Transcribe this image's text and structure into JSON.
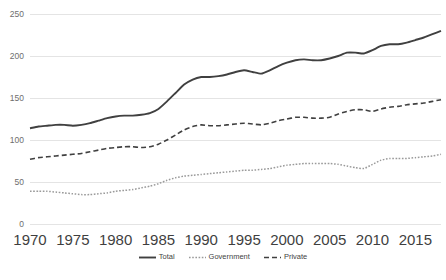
{
  "chart_data": {
    "type": "line",
    "title": "",
    "subtitle": "",
    "xlabel": "",
    "ylabel": "",
    "xlim": [
      1970,
      2018
    ],
    "ylim": [
      0,
      250
    ],
    "grid": true,
    "legend_position": "bottom",
    "x_ticks": [
      "1970",
      "1975",
      "1980",
      "1985",
      "1990",
      "1995",
      "2000",
      "2005",
      "2010",
      "2015"
    ],
    "y_ticks": [
      "0",
      "50",
      "100",
      "150",
      "200",
      "250"
    ],
    "x": [
      1970,
      1971,
      1972,
      1973,
      1974,
      1975,
      1976,
      1977,
      1978,
      1979,
      1980,
      1981,
      1982,
      1983,
      1984,
      1985,
      1986,
      1987,
      1988,
      1989,
      1990,
      1991,
      1992,
      1993,
      1994,
      1995,
      1996,
      1997,
      1998,
      1999,
      2000,
      2001,
      2002,
      2003,
      2004,
      2005,
      2006,
      2007,
      2008,
      2009,
      2010,
      2011,
      2012,
      2013,
      2014,
      2015,
      2016,
      2017,
      2018
    ],
    "series": [
      {
        "name": "Total",
        "style": "solid",
        "color": "#404040",
        "values": [
          114,
          116,
          117,
          118,
          118,
          117,
          118,
          120,
          123,
          126,
          128,
          129,
          129,
          130,
          132,
          137,
          146,
          156,
          166,
          172,
          175,
          175,
          176,
          178,
          181,
          183,
          181,
          179,
          183,
          188,
          192,
          195,
          196,
          195,
          195,
          197,
          200,
          204,
          204,
          203,
          207,
          212,
          214,
          214,
          216,
          219,
          222,
          226,
          230
        ]
      },
      {
        "name": "Government",
        "style": "dotted",
        "color": "#9a9a9a",
        "values": [
          39,
          39,
          39,
          38,
          37,
          36,
          35,
          35,
          36,
          37,
          39,
          40,
          41,
          43,
          45,
          48,
          52,
          55,
          57,
          58,
          59,
          60,
          61,
          62,
          63,
          64,
          64,
          65,
          66,
          68,
          70,
          71,
          72,
          72,
          72,
          72,
          71,
          69,
          67,
          66,
          71,
          76,
          78,
          78,
          78,
          79,
          80,
          81,
          83
        ]
      },
      {
        "name": "Private",
        "style": "dashed",
        "color": "#404040",
        "values": [
          77,
          79,
          80,
          81,
          82,
          83,
          84,
          86,
          88,
          90,
          91,
          92,
          92,
          91,
          92,
          95,
          100,
          106,
          112,
          116,
          118,
          117,
          117,
          118,
          119,
          120,
          119,
          118,
          120,
          123,
          125,
          127,
          127,
          126,
          126,
          127,
          131,
          134,
          136,
          136,
          134,
          137,
          139,
          140,
          142,
          143,
          144,
          146,
          148
        ]
      }
    ]
  },
  "legend": {
    "entries": [
      {
        "label": "Total",
        "style": "solid"
      },
      {
        "label": "Government",
        "style": "dotted"
      },
      {
        "label": "Private",
        "style": "dashed"
      }
    ]
  },
  "colors": {
    "background": "#ffffff",
    "gridline": "#e4e4e4",
    "total": "#404040",
    "government": "#9a9a9a",
    "private": "#404040",
    "tick_text": "#3f3f3f",
    "ytick_text": "#6e6e6e"
  }
}
